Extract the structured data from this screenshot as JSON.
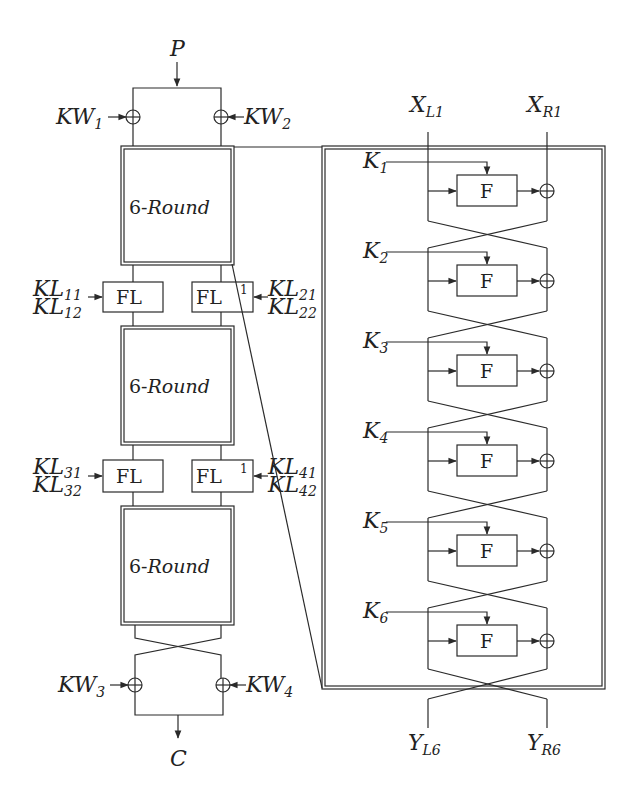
{
  "left_structure": {
    "input_label": "P",
    "output_label": "C",
    "whitening_keys": {
      "kw1": {
        "base": "KW",
        "sub": "1"
      },
      "kw2": {
        "base": "KW",
        "sub": "2"
      },
      "kw3": {
        "base": "KW",
        "sub": "3"
      },
      "kw4": {
        "base": "KW",
        "sub": "4"
      }
    },
    "round_blocks": [
      {
        "prefix": "6-",
        "label": "Round"
      },
      {
        "prefix": "6-",
        "label": "Round"
      },
      {
        "prefix": "6-",
        "label": "Round"
      }
    ],
    "fl_layers": [
      {
        "left": {
          "label": "FL",
          "keys": [
            {
              "base": "KL",
              "sub": "11"
            },
            {
              "base": "KL",
              "sub": "12"
            }
          ]
        },
        "right": {
          "label": "FL",
          "sup": "1",
          "keys": [
            {
              "base": "KL",
              "sub": "21"
            },
            {
              "base": "KL",
              "sub": "22"
            }
          ]
        }
      },
      {
        "left": {
          "label": "FL",
          "keys": [
            {
              "base": "KL",
              "sub": "31"
            },
            {
              "base": "KL",
              "sub": "32"
            }
          ]
        },
        "right": {
          "label": "FL",
          "sup": "1",
          "keys": [
            {
              "base": "KL",
              "sub": "41"
            },
            {
              "base": "KL",
              "sub": "42"
            }
          ]
        }
      }
    ]
  },
  "round_detail": {
    "inputs": [
      {
        "base": "X",
        "sub": "L1"
      },
      {
        "base": "X",
        "sub": "R1"
      }
    ],
    "outputs": [
      {
        "base": "Y",
        "sub": "L6"
      },
      {
        "base": "Y",
        "sub": "R6"
      }
    ],
    "function_label": "F",
    "round_keys": [
      {
        "base": "K",
        "sub": "1"
      },
      {
        "base": "K",
        "sub": "2"
      },
      {
        "base": "K",
        "sub": "3"
      },
      {
        "base": "K",
        "sub": "4"
      },
      {
        "base": "K",
        "sub": "5"
      },
      {
        "base": "K",
        "sub": "6"
      }
    ]
  },
  "icons": {
    "xor": "circle-plus-icon",
    "arrow": "arrowhead-icon"
  },
  "colors": {
    "line": "#2a2a2a",
    "background": "#ffffff"
  }
}
